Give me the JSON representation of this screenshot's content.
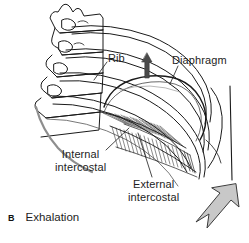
{
  "figure": {
    "panel_letter": "B",
    "caption": "Exhalation",
    "background_color": "#ffffff",
    "line_color": "#1a1a1a",
    "arrow_fill_color": "#c8c8c8",
    "arrow_outline_color": "#3a3a3a",
    "up_arrow_color": "#4a4a4a"
  },
  "labels": {
    "rib": "Rib",
    "diaphragm": "Diaphragm",
    "internal_line1": "Internal",
    "internal_line2": "intercostal",
    "external_line1": "External",
    "external_line2": "intercostal"
  },
  "arrows": {
    "diaphragm_up": "up-arrow",
    "rib_cage_down": "down-left-arrow"
  },
  "anatomy": [
    "vertebral-column",
    "ribs",
    "diaphragm-dome",
    "internal-intercostal-muscle",
    "external-intercostal-muscle",
    "body-wall"
  ]
}
